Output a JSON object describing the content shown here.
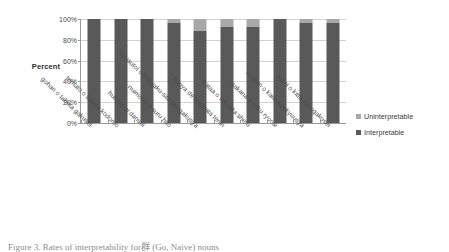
{
  "chart_data": {
    "type": "bar",
    "title": "",
    "subtitle": "",
    "xlabel": "",
    "ylabel": "Percent",
    "ylim": [
      0,
      100
    ],
    "yticks": [
      "0%",
      "20%",
      "40%",
      "60%",
      "80%",
      "100%"
    ],
    "ytick_values": [
      0,
      20,
      40,
      60,
      80,
      100
    ],
    "grid": true,
    "stacked": true,
    "legend_position": "right",
    "categories": [
      "gohan o tabeta gakusei",
      "tomato o tabeta kodomo",
      "hutoranai dansei",
      "nuimono o suru hito",
      "torusutoi o honyaku-sita bungakusya",
      "honya de hatarata tenin",
      "bataa o tokasita shefu",
      "sakana o yaku ryoosi",
      "ronbun o kaita kenkyuusya",
      "kami o kitta syoogakusei"
    ],
    "series": [
      {
        "name": "Interpretable",
        "color": "#595959",
        "values": [
          100,
          100,
          100,
          96,
          88,
          92,
          92,
          100,
          96,
          96
        ]
      },
      {
        "name": "Uninterpretable",
        "color": "#a8a8a8",
        "values": [
          0,
          0,
          0,
          4,
          12,
          8,
          8,
          0,
          4,
          4
        ]
      }
    ]
  },
  "legend": {
    "items": [
      {
        "label": "Uninterpretable",
        "color": "#a8a8a8"
      },
      {
        "label": "Interpretable",
        "color": "#595959"
      }
    ]
  },
  "caption": {
    "text": "Figure 3. Rates of interpretability for群 (Go, Naive) nouns"
  }
}
